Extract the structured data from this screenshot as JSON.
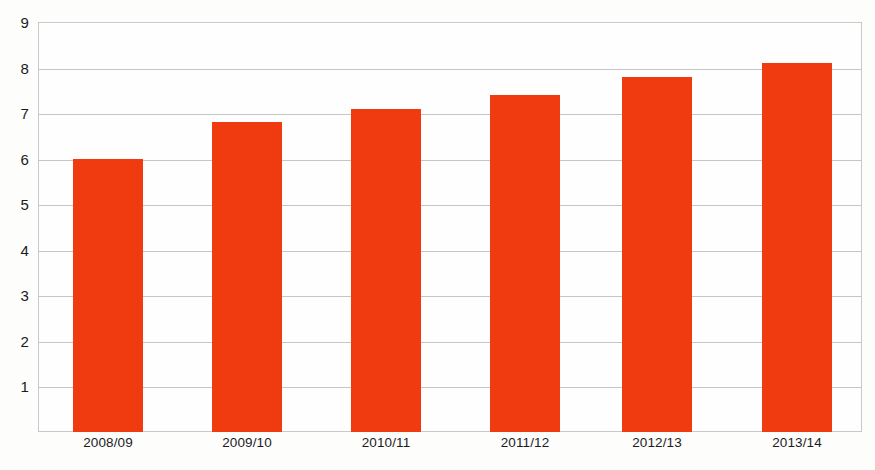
{
  "chart_data": {
    "type": "bar",
    "title": "",
    "subtitle": "",
    "xlabel": "",
    "ylabel": "",
    "categories": [
      "2008/09",
      "2009/10",
      "2010/11",
      "2011/12",
      "2012/13",
      "2013/14"
    ],
    "values": [
      6.0,
      6.8,
      7.1,
      7.4,
      7.8,
      8.1
    ],
    "series": [
      {
        "name": "",
        "values": [
          6.0,
          6.8,
          7.1,
          7.4,
          7.8,
          8.1
        ]
      }
    ],
    "ylim": [
      0,
      9
    ],
    "xlim": null,
    "y_ticks": [
      1,
      2,
      3,
      4,
      5,
      6,
      7,
      8,
      9
    ],
    "y_tick_labels": [
      "1",
      "2",
      "3",
      "4",
      "5",
      "6",
      "7",
      "8",
      "9"
    ],
    "x_tick_labels": [
      "2008/09",
      "2009/10",
      "2010/11",
      "2011/12",
      "2012/13",
      "2013/14"
    ],
    "grid": true,
    "grid_axis": "y",
    "legend": false,
    "legend_position": "none",
    "annotations": [],
    "bar_color": "#f03a10",
    "grid_color": "#c6c6c6",
    "axis_color": "#c9c9c9",
    "text_color": "#1b1b1b",
    "background_color": "#fdfdfc"
  }
}
